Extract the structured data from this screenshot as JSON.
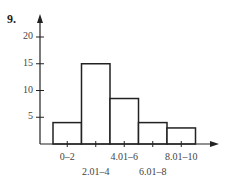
{
  "problem_number": "9.",
  "chart_data": {
    "type": "bar",
    "subtype": "histogram",
    "title": "",
    "xlabel": "",
    "ylabel": "",
    "categories": [
      "0–2",
      "2.01–4",
      "4.01–6",
      "6.01–8",
      "8.01–10"
    ],
    "values": [
      4,
      15,
      8.5,
      4,
      3
    ],
    "yticks": [
      "5",
      "10",
      "15",
      "20"
    ],
    "ylim": [
      0,
      22
    ],
    "grid": false,
    "legend": null
  }
}
